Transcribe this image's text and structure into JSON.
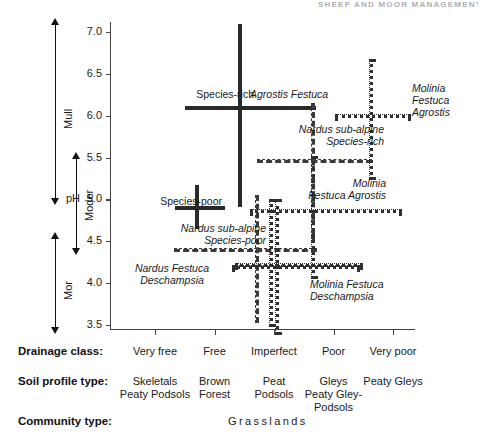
{
  "header": {
    "running_head": "SHEEP AND MOOR MANAGEMENT"
  },
  "axes": {
    "y_axis_label": "pH",
    "y_ticks": [
      "7.0",
      "6.5",
      "6.0",
      "5.5",
      "5.0",
      "4.5",
      "4.0",
      "3.5"
    ],
    "y_tick_values": [
      7.0,
      6.5,
      6.0,
      5.5,
      5.0,
      4.5,
      4.0,
      3.5
    ],
    "y_range": [
      3.5,
      7.0
    ]
  },
  "humus_scale": {
    "items": [
      {
        "label": "Mull",
        "from_ph": 7.15,
        "to_ph": 4.95
      },
      {
        "label": "Moder",
        "from_ph": 5.55,
        "to_ph": 4.35
      },
      {
        "label": "Mor",
        "from_ph": 4.6,
        "to_ph": 3.4
      }
    ]
  },
  "chart_data": {
    "type": "scatter",
    "title": "",
    "xlabel": "Drainage class",
    "ylabel": "pH",
    "ylim": [
      3.5,
      7.0
    ],
    "grid": false,
    "legend": "none",
    "x_categories": [
      "Very free",
      "Free",
      "Imperfect",
      "Poor",
      "Very poor"
    ],
    "x_positions": [
      1,
      2,
      3,
      4,
      5
    ],
    "annotations": [
      {
        "name": "species-rich-agrostis-festuca",
        "label_prefix": "Species-rich",
        "label": "Agrostis Festuca",
        "line_style": "solid",
        "centre_x": 2.4,
        "centre_ph": 6.12,
        "x_span": [
          1.5,
          3.6
        ],
        "ph_span": [
          7.1,
          4.98
        ]
      },
      {
        "name": "species-poor-nardus-sub-alpine",
        "label_prefix": "Species-poor",
        "label": "Nardus sub-alpine\nSpecies-poor",
        "line_style": "solid-and-dashed",
        "centre_x": 1.67,
        "centre_ph": 4.92,
        "x_span": [
          1.33,
          2.07
        ],
        "ph_span": [
          5.17,
          4.72
        ]
      },
      {
        "name": "nardus-sub-alpine-species-poor",
        "label": "Nardus sub-alpine\nSpecies-poor",
        "line_style": "dashed",
        "centre_x": 2.68,
        "centre_ph": 4.42,
        "x_span": [
          1.32,
          3.62
        ],
        "ph_span": [
          5.05,
          3.6
        ]
      },
      {
        "name": "nardus-festuca-deschampsia",
        "label": "Nardus Festuca\nDeschampsia",
        "line_style": "dotted",
        "centre_x": 2.92,
        "centre_ph": 4.24,
        "x_span": [
          2.35,
          4.4
        ],
        "ph_span": [
          5.0,
          3.55
        ]
      },
      {
        "name": "nardus-sub-alpine-species-rich",
        "label": "Nardus sub-alpine\nSpecies-rich",
        "line_style": "dashed",
        "centre_x": 3.62,
        "centre_ph": 5.48,
        "x_span": [
          2.72,
          4.55
        ],
        "ph_span": [
          6.15,
          4.55
        ]
      },
      {
        "name": "molinia-festuca-agrostis-upper",
        "label": "Molinia\nFestuca Agrostis",
        "line_style": "dotted",
        "centre_x": 4.6,
        "centre_ph": 6.02,
        "x_span": [
          4.02,
          5.2
        ],
        "ph_span": [
          6.68,
          5.3
        ]
      },
      {
        "name": "molinia-festuca-agrostis-lower",
        "label": "Molinia\nFestuca Agrostis",
        "line_style": "dotted",
        "centre_x": 3.62,
        "centre_ph": 4.88,
        "x_span": [
          2.6,
          5.05
        ],
        "ph_span": [
          5.52,
          4.12
        ]
      },
      {
        "name": "molinia-festuca-deschampsia",
        "label": "Molinia Festuca\nDeschampsia",
        "line_style": "dotted",
        "centre_x": 3.02,
        "centre_ph": 4.22,
        "x_span": [
          2.3,
          4.35
        ],
        "ph_span": [
          5.0,
          3.45
        ]
      }
    ]
  },
  "table": {
    "rows": [
      {
        "name": "drainage-class",
        "label": "Drainage class:",
        "cells": [
          "Very free",
          "Free",
          "Imperfect",
          "Poor",
          "Very poor"
        ]
      },
      {
        "name": "soil-profile-type",
        "label": "Soil profile type:",
        "cells": [
          "Skeletals\nPeaty Podsols",
          "Brown\nForest",
          "Peat\nPodsols",
          "Gleys\nPeaty Gley-\nPodsols",
          "Peaty Gleys"
        ]
      },
      {
        "name": "community-type",
        "label": "Community type:",
        "cells": [
          "Grasslands"
        ]
      }
    ]
  }
}
